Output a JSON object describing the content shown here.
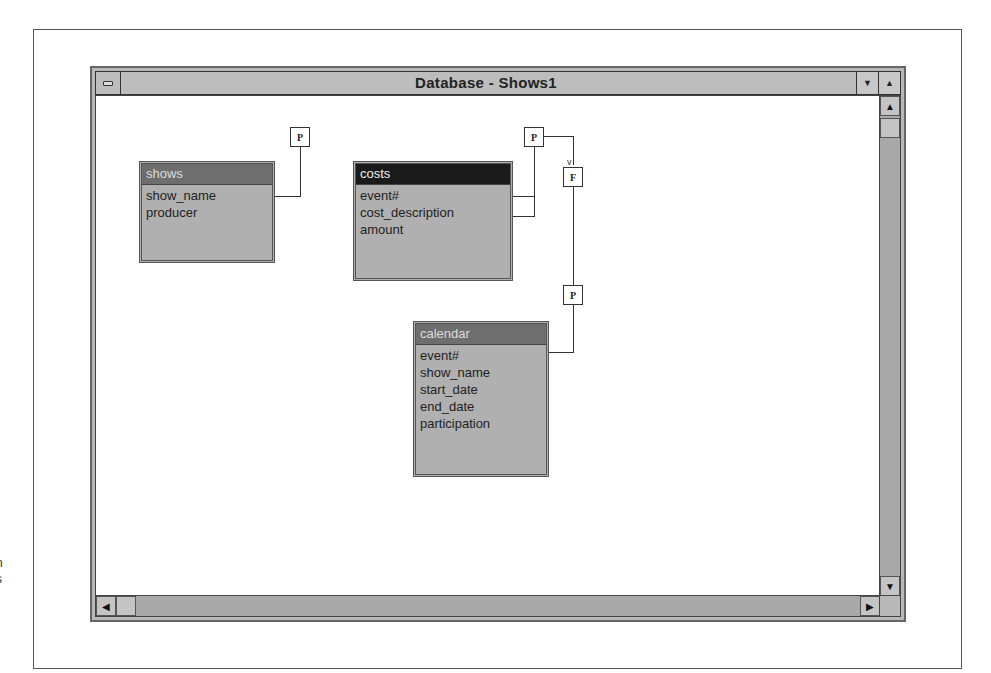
{
  "window": {
    "title": "Database - Shows1",
    "controls": {
      "minimize_icon": "▼",
      "maximize_icon": "▲"
    }
  },
  "scrollbars": {
    "up_icon": "▲",
    "down_icon": "▼",
    "left_icon": "◀",
    "right_icon": "▶"
  },
  "tables": [
    {
      "name": "shows",
      "fields": [
        "show_name",
        "producer"
      ]
    },
    {
      "name": "costs",
      "fields": [
        "event#",
        "cost_description",
        "amount"
      ]
    },
    {
      "name": "calendar",
      "fields": [
        "event#",
        "show_name",
        "start_date",
        "end_date",
        "participation"
      ]
    }
  ],
  "keys": {
    "primary_label": "P",
    "foreign_label": "F"
  },
  "edge_fragments": [
    "l",
    "n",
    "s"
  ]
}
